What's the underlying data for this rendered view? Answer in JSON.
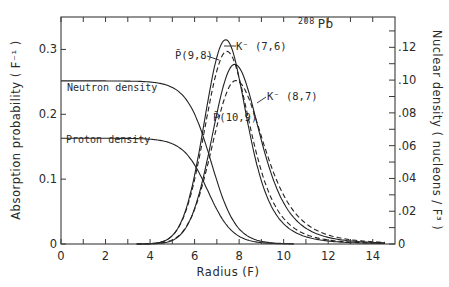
{
  "chart_data": {
    "type": "line",
    "title": "",
    "nucleus_label": "208 Pb",
    "nucleus_mass": "208",
    "nucleus_symbol": "Pb",
    "xlabel": "Radius  (F)",
    "ylabel_left": "Absorption probability  ( F⁻¹ )",
    "ylabel_right": "Nuclear density  ( nucleons / F³ )",
    "xlim": [
      0,
      15
    ],
    "ylim_left": [
      0,
      0.35
    ],
    "ylim_right": [
      0,
      0.1385
    ],
    "x_ticks": [
      0,
      2,
      4,
      6,
      8,
      10,
      12,
      14
    ],
    "x_tick_labels": [
      "0",
      "2",
      "4",
      "6",
      "8",
      "10",
      "12",
      "14"
    ],
    "x_minor_ticks": [
      1,
      3,
      5,
      7,
      9,
      11,
      13
    ],
    "y_left_ticks": [
      0,
      0.1,
      0.2,
      0.3
    ],
    "y_left_tick_labels": [
      "0",
      "0.1",
      "0.2",
      "0.3"
    ],
    "y_right_ticks": [
      0,
      0.02,
      0.04,
      0.06,
      0.08,
      0.1,
      0.12
    ],
    "y_right_tick_labels": [
      "0",
      ".02",
      ".04",
      ".06",
      ".08",
      ".10",
      ".12"
    ],
    "y_right_minor_ticks": [
      0.01,
      0.03,
      0.05,
      0.07,
      0.09,
      0.11,
      0.13
    ],
    "grid": false,
    "legend": "inline annotations",
    "series": [
      {
        "name": "Neutron density",
        "axis": "right",
        "style": "solid",
        "model": "fermi",
        "rho0": 0.0995,
        "c": 6.75,
        "a": 0.55,
        "x": [
          0,
          2,
          4,
          5,
          6,
          6.75,
          7,
          8,
          9,
          10
        ],
        "values": [
          0.0995,
          0.0995,
          0.0989,
          0.0955,
          0.0787,
          0.0498,
          0.0393,
          0.009,
          0.0016,
          0.0003
        ]
      },
      {
        "name": "Proton density",
        "axis": "right",
        "style": "solid",
        "model": "fermi",
        "rho0": 0.0645,
        "c": 6.6,
        "a": 0.55,
        "x": [
          0,
          2,
          4,
          5,
          6,
          6.6,
          7,
          8,
          9,
          10
        ],
        "values": [
          0.0645,
          0.0645,
          0.0636,
          0.0609,
          0.0485,
          0.0323,
          0.0215,
          0.0047,
          0.0008,
          0.0001
        ]
      },
      {
        "name": "K⁻ (7,6)",
        "axis": "left",
        "style": "solid",
        "peak_r": 7.4,
        "peak_value": 0.315,
        "sigma_left": 0.95,
        "sigma_right": 1.1,
        "x": [
          4,
          5,
          6,
          7,
          7.4,
          8,
          9,
          10,
          11,
          12,
          13,
          14
        ],
        "values": [
          0.002,
          0.03,
          0.15,
          0.29,
          0.315,
          0.27,
          0.14,
          0.05,
          0.015,
          0.004,
          0.001,
          0.0
        ]
      },
      {
        "name": "P̄ (9,8)",
        "axis": "left",
        "style": "dashed",
        "peak_r": 7.45,
        "peak_value": 0.297,
        "sigma_left": 0.98,
        "sigma_right": 1.2,
        "x": [
          4,
          5,
          6,
          7,
          7.45,
          8,
          9,
          10,
          11,
          12,
          13,
          14
        ],
        "values": [
          0.003,
          0.04,
          0.15,
          0.27,
          0.297,
          0.26,
          0.15,
          0.06,
          0.02,
          0.006,
          0.002,
          0.0
        ]
      },
      {
        "name": "K⁻ (8,7)",
        "axis": "left",
        "style": "solid",
        "peak_r": 7.8,
        "peak_value": 0.277,
        "sigma_left": 1.0,
        "sigma_right": 1.3,
        "x": [
          4,
          5,
          6,
          7,
          7.8,
          8,
          9,
          10,
          11,
          12,
          13,
          14
        ],
        "values": [
          0.001,
          0.02,
          0.11,
          0.23,
          0.277,
          0.275,
          0.19,
          0.09,
          0.035,
          0.01,
          0.003,
          0.0
        ]
      },
      {
        "name": "P̄ (10,9)",
        "axis": "left",
        "style": "dashed",
        "peak_r": 7.85,
        "peak_value": 0.252,
        "sigma_left": 1.05,
        "sigma_right": 1.45,
        "x": [
          4,
          5,
          6,
          7,
          7.85,
          8,
          9,
          10,
          11,
          12,
          13,
          14
        ],
        "values": [
          0.001,
          0.02,
          0.1,
          0.21,
          0.252,
          0.25,
          0.19,
          0.1,
          0.045,
          0.015,
          0.005,
          0.001
        ]
      }
    ],
    "annotations": [
      {
        "text": "K⁻ (7,6)",
        "points_to_series": "K⁻ (7,6)"
      },
      {
        "text": "P̄ (9,8)",
        "points_to_series": "P̄ (9,8)"
      },
      {
        "text": "K⁻ (8,7)",
        "points_to_series": "K⁻ (8,7)"
      },
      {
        "text": "P̄ (10,9)",
        "points_to_series": "P̄ (10,9)"
      },
      {
        "text": "Neutron density"
      },
      {
        "text": "Proton density"
      }
    ]
  },
  "labels": {
    "neutron_density": "Neutron density",
    "proton_density": "Proton density",
    "k76": "K⁻ (7,6)",
    "p98": "P̄(9,8)",
    "k87": "K⁻ (8,7)",
    "p109": "P̄(10,9)"
  }
}
